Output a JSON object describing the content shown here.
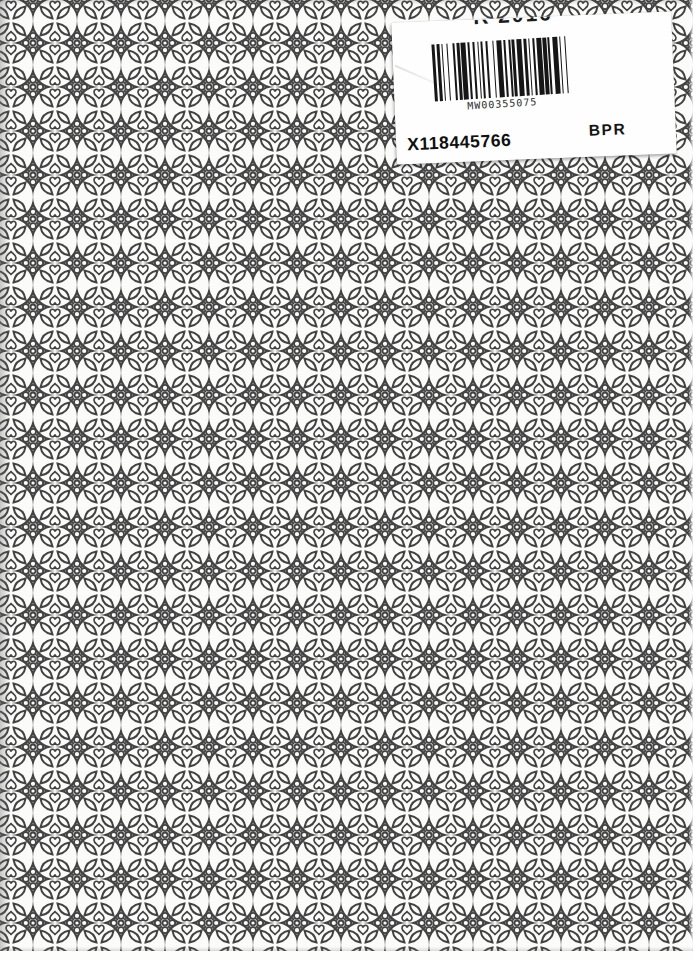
{
  "page": {
    "kind": "scanned book cover with ornamental lattice pattern and shipping/inventory sticker",
    "width": 693,
    "height": 960
  },
  "colors": {
    "pattern_ink": "#434343",
    "paper": "#fbfbfa",
    "label_background": "#fefefe",
    "barcode_ink": "#161616"
  },
  "label": {
    "clipped_top_text": "R 2016",
    "barcode": {
      "number": "MW00355075",
      "bars": "21211213112131121211121312311211213121121131211231121"
    },
    "code_left": "X118445766",
    "code_right": "BPR"
  }
}
